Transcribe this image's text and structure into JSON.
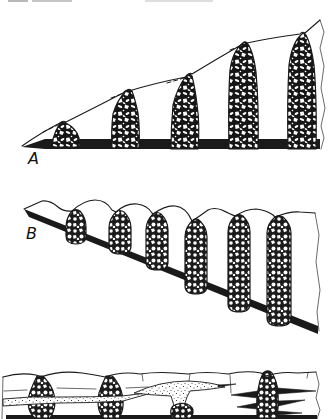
{
  "figure": {
    "panel_a": {
      "label": "A"
    },
    "panel_b": {
      "label": "B"
    },
    "panel_c": {
      "label": ""
    },
    "colors": {
      "ink": "#1a1a1a",
      "paper": "#ffffff",
      "bed_black": "#1a1a1a"
    }
  }
}
